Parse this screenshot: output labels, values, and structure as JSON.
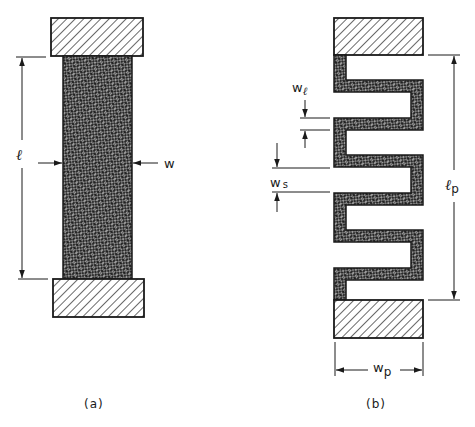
{
  "figure": {
    "type": "engineering-diagram",
    "colors": {
      "ink": "#1a1a1a",
      "background": "#ffffff",
      "crosshatch_fill": "#3a3a3a"
    },
    "panel_a": {
      "caption": "(a)",
      "length_label": "ℓ",
      "width_label": "w",
      "description": "Straight rectangular strip (crosshatched) between two diagonally-hatched end blocks"
    },
    "panel_b": {
      "caption": "(b)",
      "line_width_label_main": "w",
      "line_width_label_sub": "ℓ",
      "spacing_label_main": "w",
      "spacing_label_sub": "s",
      "length_label_main": "ℓ",
      "length_label_sub": "p",
      "width_label_main": "w",
      "width_label_sub": "p",
      "description": "Meandered (serpentine) strip between two diagonally-hatched end blocks"
    }
  }
}
